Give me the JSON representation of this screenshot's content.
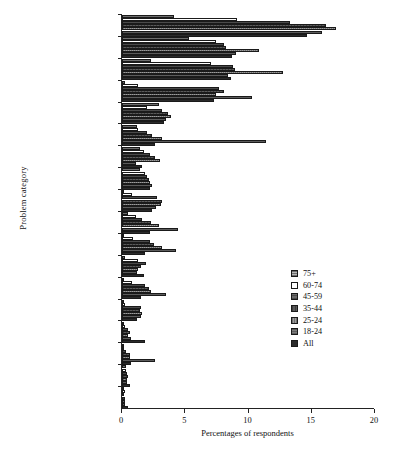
{
  "chart_data": {
    "type": "bar",
    "orientation": "horizontal",
    "title": "",
    "xlabel": "Percentages of respondents",
    "ylabel": "Problem category",
    "xlim": [
      0,
      20
    ],
    "xticks": [
      0,
      5,
      10,
      15,
      20
    ],
    "grid": false,
    "legend_position": "right",
    "categories": [
      "Consumer",
      "Neighbours",
      "Money / Debt",
      "Employment",
      "Personal injury",
      "Housing (rent)",
      "Housing (own)",
      "Welfare benefits",
      "Relat. breakdown",
      "Divorce",
      "Children",
      "Clinical negligence",
      "Domestic violence",
      "Discrimination",
      "Police treatment",
      "Homelessness",
      "Mental health",
      "Immigration"
    ],
    "series": [
      {
        "name": "75+",
        "values": [
          4.1,
          5.3,
          2.3,
          0.2,
          2.9,
          1.2,
          1.4,
          1.4,
          0.1,
          0.5,
          0.1,
          0.2,
          0.1,
          0.1,
          0.1,
          0.1,
          0.3,
          0.1
        ]
      },
      {
        "name": "60-74",
        "values": [
          9.1,
          7.4,
          7.0,
          1.3,
          2.0,
          1.3,
          1.7,
          1.8,
          0.8,
          1.1,
          0.9,
          1.3,
          0.8,
          0.2,
          0.2,
          0.1,
          0.3,
          0.2
        ]
      },
      {
        "name": "45-59",
        "values": [
          13.3,
          8.1,
          8.8,
          7.7,
          3.2,
          2.0,
          2.2,
          2.0,
          2.8,
          1.6,
          2.2,
          1.9,
          1.8,
          1.5,
          0.5,
          0.3,
          0.4,
          0.1
        ]
      },
      {
        "name": "35-44",
        "values": [
          16.1,
          8.2,
          8.9,
          8.1,
          3.6,
          2.4,
          2.6,
          2.1,
          3.2,
          2.3,
          2.5,
          1.5,
          2.1,
          1.4,
          0.6,
          0.6,
          0.5,
          0.2
        ]
      },
      {
        "name": "25-24",
        "values": [
          16.9,
          10.8,
          12.7,
          7.4,
          3.9,
          3.2,
          3.0,
          2.2,
          3.1,
          2.9,
          3.2,
          1.3,
          2.3,
          1.6,
          0.5,
          0.6,
          0.4,
          0.2
        ]
      },
      {
        "name": "18-24",
        "values": [
          15.8,
          9.0,
          8.4,
          10.3,
          3.5,
          11.4,
          1.1,
          2.4,
          2.7,
          4.4,
          4.3,
          1.2,
          3.5,
          1.5,
          0.7,
          2.6,
          0.4,
          0.2
        ]
      },
      {
        "name": "All",
        "values": [
          14.6,
          8.7,
          8.6,
          7.3,
          3.3,
          2.6,
          1.6,
          2.2,
          2.4,
          2.2,
          1.8,
          1.7,
          1.5,
          1.2,
          1.8,
          0.7,
          0.6,
          0.5
        ]
      }
    ]
  },
  "legend": {
    "entries": [
      {
        "label": "75+"
      },
      {
        "label": "60-74"
      },
      {
        "label": "45-59"
      },
      {
        "label": "35-44"
      },
      {
        "label": "25-24"
      },
      {
        "label": "18-24"
      },
      {
        "label": "All"
      }
    ]
  }
}
